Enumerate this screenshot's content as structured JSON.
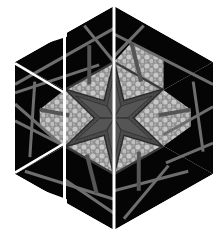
{
  "figure": {
    "title": "",
    "fabrics": {
      "black": "#050505",
      "stripe": "#6e6e6e",
      "stone": "#a9a9a9",
      "stone_dots": "#d4d4d4",
      "star": "#4a4a4a",
      "star_edge": "#2a2a2a",
      "seam": "#ffffff"
    },
    "strips": [
      {
        "name": "left-strip",
        "columns": 1,
        "offset": "split into 3 separated pieces"
      },
      {
        "name": "center-left-strip",
        "columns": 1
      },
      {
        "name": "right-strips",
        "columns": 2
      }
    ]
  }
}
